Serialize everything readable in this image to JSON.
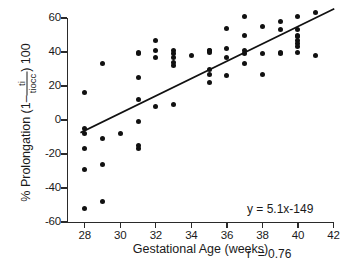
{
  "chart_data": {
    "type": "scatter",
    "title": "",
    "xlabel": "Gestational Age (weeks)",
    "ylabel_parts": {
      "prefix": "% Prolongation (1",
      "minus": "–",
      "numerator": "ti",
      "denominator": "tiocc",
      "suffix": ") 100"
    },
    "ylabel_plain": "% Prolongation (1 - ti/tiocc) 100",
    "xlim": [
      27,
      42
    ],
    "ylim": [
      -60,
      60
    ],
    "xticks": [
      28,
      30,
      32,
      34,
      36,
      38,
      40,
      42
    ],
    "yticks": [
      60,
      40,
      20,
      0,
      -20,
      -40,
      -60
    ],
    "grid": false,
    "legend": null,
    "marker": "filled-circle",
    "marker_color": "#111111",
    "points": [
      [
        28,
        16
      ],
      [
        28,
        -5
      ],
      [
        28,
        -8
      ],
      [
        28,
        -17
      ],
      [
        28,
        -29
      ],
      [
        28,
        -52
      ],
      [
        29,
        33
      ],
      [
        29,
        -11
      ],
      [
        29,
        -26
      ],
      [
        29,
        -48
      ],
      [
        30,
        -8
      ],
      [
        31,
        40
      ],
      [
        31,
        39
      ],
      [
        31,
        25
      ],
      [
        31,
        12
      ],
      [
        31,
        -1
      ],
      [
        31,
        -15
      ],
      [
        31,
        -17
      ],
      [
        32,
        47
      ],
      [
        32,
        41
      ],
      [
        32,
        37
      ],
      [
        32,
        8
      ],
      [
        33,
        41
      ],
      [
        33,
        39
      ],
      [
        33,
        37
      ],
      [
        33,
        34
      ],
      [
        33,
        32
      ],
      [
        33,
        9
      ],
      [
        34,
        38
      ],
      [
        35,
        41
      ],
      [
        35,
        41
      ],
      [
        35,
        40
      ],
      [
        35,
        30
      ],
      [
        35,
        27
      ],
      [
        35,
        22
      ],
      [
        36,
        54
      ],
      [
        36,
        42
      ],
      [
        36,
        37
      ],
      [
        36,
        26
      ],
      [
        37,
        61
      ],
      [
        37,
        50
      ],
      [
        37,
        41
      ],
      [
        37,
        39
      ],
      [
        37,
        33
      ],
      [
        38,
        55
      ],
      [
        38,
        39
      ],
      [
        38,
        27
      ],
      [
        39,
        58
      ],
      [
        39,
        53
      ],
      [
        39,
        40
      ],
      [
        39,
        39
      ],
      [
        40,
        61
      ],
      [
        40,
        53
      ],
      [
        40,
        50
      ],
      [
        40,
        49
      ],
      [
        40,
        47
      ],
      [
        40,
        45
      ],
      [
        40,
        43
      ],
      [
        40,
        40
      ],
      [
        41,
        63
      ],
      [
        41,
        38
      ]
    ],
    "fit_line": {
      "equation": "y = 5.1x-149",
      "slope": 5.1,
      "intercept": -149,
      "x_start": 27.8,
      "x_end": 42.0,
      "correlation_label": "r  = 0.76",
      "r": 0.76
    },
    "annotations": [
      "y = 5.1x-149",
      "r  = 0.76"
    ]
  }
}
